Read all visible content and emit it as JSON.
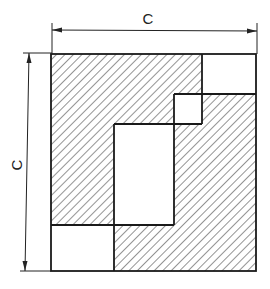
{
  "diagram": {
    "type": "hatched-square-tiling",
    "labels": {
      "horizontal_dimension": "C",
      "vertical_dimension": "C"
    },
    "colors": {
      "line": "#1a1a1a",
      "hatch": "#3a3a3a",
      "background": "#ffffff"
    },
    "outer_square": {
      "x1": 51,
      "y1": 54,
      "x2": 256,
      "y2": 271
    },
    "white_regions": [
      {
        "name": "top-right-rect",
        "x1": 202,
        "y1": 54,
        "x2": 256,
        "y2": 94
      },
      {
        "name": "small-center-square",
        "x1": 174,
        "y1": 94,
        "x2": 202,
        "y2": 124
      },
      {
        "name": "inner-center-rect",
        "x1": 114,
        "y1": 124,
        "x2": 174,
        "y2": 225
      },
      {
        "name": "bottom-left-square",
        "x1": 51,
        "y1": 225,
        "x2": 114,
        "y2": 271
      }
    ],
    "hatch": {
      "angle_deg": 45,
      "spacing_px": 6
    }
  }
}
